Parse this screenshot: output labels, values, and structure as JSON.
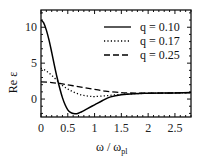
{
  "chart_data": {
    "type": "line",
    "title": "",
    "xlabel": "ω / ω_pl",
    "xlabel_main": "ω / ω",
    "xlabel_sub": "pl",
    "ylabel": "Re ε",
    "xlim": [
      0,
      2.8
    ],
    "ylim": [
      -2.5,
      12.4
    ],
    "xticks": [
      0,
      0.5,
      1,
      1.5,
      2,
      2.5
    ],
    "xtick_labels": [
      "0",
      "0.5",
      "1",
      "1.5",
      "2",
      "2.5"
    ],
    "yticks": [
      0,
      5,
      10
    ],
    "ytick_labels": [
      "0",
      "5",
      "10"
    ],
    "grid": false,
    "legend_position": "upper right",
    "series": [
      {
        "name": "q = 0.10",
        "style": "solid",
        "x": [
          0,
          0.05,
          0.1,
          0.15,
          0.2,
          0.25,
          0.3,
          0.35,
          0.4,
          0.45,
          0.5,
          0.55,
          0.6,
          0.67,
          0.75,
          0.85,
          1.0,
          1.15,
          1.3,
          1.5,
          1.75,
          2.0,
          2.5,
          2.8
        ],
        "y": [
          11.0,
          10.6,
          9.6,
          8.2,
          6.5,
          4.7,
          3.0,
          1.5,
          0.2,
          -0.8,
          -1.5,
          -1.85,
          -2.0,
          -2.05,
          -1.8,
          -1.4,
          -0.8,
          -0.2,
          0.3,
          0.6,
          0.75,
          0.8,
          0.85,
          0.9
        ]
      },
      {
        "name": "q = 0.17",
        "style": "dotted",
        "x": [
          0,
          0.1,
          0.2,
          0.3,
          0.4,
          0.5,
          0.6,
          0.7,
          0.8,
          0.9,
          1.0,
          1.2,
          1.4,
          1.6,
          2.0,
          2.5,
          2.8
        ],
        "y": [
          4.3,
          3.9,
          3.3,
          2.6,
          1.9,
          1.4,
          1.0,
          0.7,
          0.5,
          0.4,
          0.35,
          0.45,
          0.6,
          0.7,
          0.8,
          0.85,
          0.9
        ]
      },
      {
        "name": "q = 0.25",
        "style": "dashed",
        "x": [
          0,
          0.2,
          0.4,
          0.6,
          0.8,
          1.0,
          1.2,
          1.4,
          1.6,
          2.0,
          2.5,
          2.8
        ],
        "y": [
          2.4,
          2.3,
          2.1,
          1.85,
          1.6,
          1.35,
          1.1,
          0.95,
          0.85,
          0.82,
          0.85,
          0.9
        ]
      }
    ]
  },
  "legend": {
    "items": [
      {
        "label": "q = 0.10",
        "style": "solid"
      },
      {
        "label": "q = 0.17",
        "style": "dotted"
      },
      {
        "label": "q = 0.25",
        "style": "dashed"
      }
    ]
  },
  "colors": {
    "line": "#000000",
    "frame": "#111111",
    "background": "#ffffff"
  }
}
